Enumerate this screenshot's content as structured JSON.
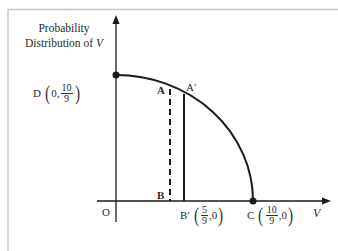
{
  "diagram": {
    "y_axis_title_line1": "Probability",
    "y_axis_title_line2": "Distribution of",
    "y_axis_title_var": "V",
    "x_axis_label": "V",
    "origin_label": "O",
    "points": {
      "D": {
        "name": "D",
        "x": "0",
        "y_num": "10",
        "y_den": "9"
      },
      "C": {
        "name": "C",
        "x_num": "10",
        "x_den": "9",
        "y": "0"
      },
      "B_prime": {
        "name": "B′",
        "x_num": "5",
        "x_den": "9",
        "y": "0"
      },
      "A": {
        "name": "A"
      },
      "A_prime": {
        "name": "A′"
      },
      "B": {
        "name": "B"
      }
    },
    "colors": {
      "axis": "#1a1a1a",
      "curve": "#1a1a1a",
      "frame": "#c8c8c8",
      "text": "#2a2a2a"
    }
  }
}
